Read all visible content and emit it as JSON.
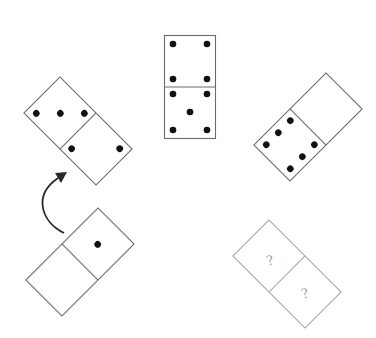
{
  "puzzle": {
    "type": "domino-sequence",
    "dominoes": [
      {
        "id": "top",
        "position": "top-center",
        "halves": [
          4,
          5
        ],
        "rotation_deg": 0
      },
      {
        "id": "left",
        "position": "upper-left",
        "halves": [
          3,
          2
        ],
        "rotation_deg": -45
      },
      {
        "id": "right",
        "position": "upper-right",
        "halves": [
          0,
          6
        ],
        "rotation_deg": 45
      },
      {
        "id": "bottom-left",
        "position": "lower-left",
        "halves": [
          1,
          0
        ],
        "rotation_deg": 45
      },
      {
        "id": "bottom-right",
        "position": "lower-right",
        "halves": [
          "?",
          "?"
        ],
        "rotation_deg": -45
      }
    ],
    "unknown_symbol": "?",
    "arrow": {
      "direction": "clockwise",
      "from": "bottom-left",
      "to": "left"
    },
    "colors": {
      "pip": "#111111",
      "outline": "#6a6a6a",
      "unknown_outline": "#a8a8a8",
      "arrow": "#2a2a2a"
    }
  }
}
